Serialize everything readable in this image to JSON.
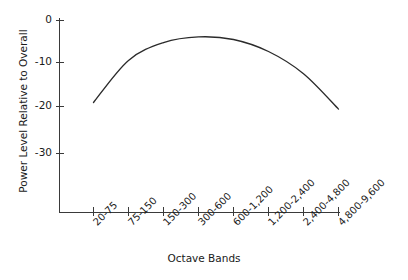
{
  "chart_data": {
    "type": "line",
    "title": "",
    "xlabel": "Octave Bands",
    "ylabel": "Power Level Relative to Overall",
    "categories": [
      "20-75",
      "75-150",
      "150-300",
      "300-600",
      "600-1,200",
      "1,200-2,400",
      "2,400-4,800",
      "4,800-9,600"
    ],
    "values": [
      -18.5,
      -9.0,
      -5.0,
      -3.7,
      -4.3,
      -7.0,
      -12.0,
      -20.0
    ],
    "ytick_labels": [
      "0",
      "-10",
      "-20",
      "-30"
    ],
    "ytick_values": [
      0,
      -10,
      -20,
      -30
    ],
    "ylim": [
      -34,
      1
    ],
    "grid": false,
    "legend": false,
    "series": [
      {
        "name": "Power Level Relative to Overall",
        "values": [
          -18.5,
          -9.0,
          -5.0,
          -3.7,
          -4.3,
          -7.0,
          -12.0,
          -20.0
        ]
      }
    ],
    "curve_color": "#2b2b2b",
    "axis_color": "#3a3a3a",
    "background_color": "#ffffff"
  }
}
